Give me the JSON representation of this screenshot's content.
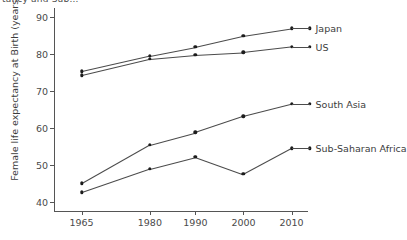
{
  "clipped_header": "tancy and Sub...",
  "chart_data": {
    "type": "line",
    "title": "",
    "xlabel": "",
    "ylabel": "Female life expectancy at Birth (years)",
    "categories": [
      "1965",
      "1980",
      "1990",
      "2000",
      "2010"
    ],
    "xtick_positions": [
      0.105,
      0.375,
      0.555,
      0.745,
      0.935
    ],
    "ylim": [
      37.5,
      92.5
    ],
    "yticks": [
      40,
      50,
      60,
      70,
      80,
      90
    ],
    "grid": false,
    "legend_position": "right-inline",
    "series": [
      {
        "name": "Japan",
        "values": [
          75.4,
          79.6,
          82.0,
          85.0,
          87.0
        ]
      },
      {
        "name": "US",
        "values": [
          74.3,
          78.7,
          79.8,
          80.5,
          82.0
        ]
      },
      {
        "name": "South Asia",
        "values": [
          45.0,
          55.5,
          58.8,
          63.2,
          66.5
        ]
      },
      {
        "name": "Sub-Saharan Africa",
        "values": [
          42.6,
          49.0,
          52.2,
          47.5,
          54.5
        ]
      }
    ]
  }
}
